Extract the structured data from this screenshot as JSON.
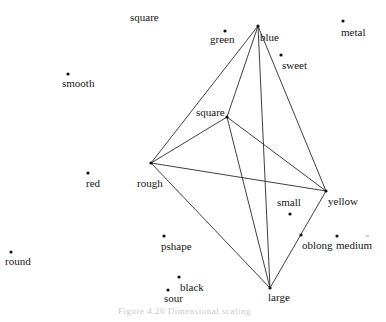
{
  "figure": {
    "caption": "Figure 4.26   Dimensional scaling"
  },
  "nodes": [
    {
      "id": "blue",
      "label": "blue",
      "x": 258,
      "y": 26,
      "lx": 260,
      "ly": 41,
      "dot": true
    },
    {
      "id": "green",
      "label": "green",
      "x": 225,
      "y": 31,
      "lx": 210,
      "ly": 43,
      "dot": true
    },
    {
      "id": "metal",
      "label": "metal",
      "x": 343,
      "y": 21,
      "lx": 341,
      "ly": 36,
      "dot": true
    },
    {
      "id": "sweet",
      "label": "sweet",
      "x": 281,
      "y": 55,
      "lx": 282,
      "ly": 69,
      "dot": true
    },
    {
      "id": "square-top",
      "label": "square",
      "x": 0,
      "y": 0,
      "lx": 130,
      "ly": 21,
      "dot": false
    },
    {
      "id": "smooth",
      "label": "smooth",
      "x": 68,
      "y": 74,
      "lx": 62,
      "ly": 87,
      "dot": true
    },
    {
      "id": "square",
      "label": "square",
      "x": 227,
      "y": 117,
      "lx": 196,
      "ly": 116,
      "dot": true
    },
    {
      "id": "rough",
      "label": "rough",
      "x": 151,
      "y": 163,
      "lx": 137,
      "ly": 187,
      "dot": true
    },
    {
      "id": "red",
      "label": "red",
      "x": 88,
      "y": 173,
      "lx": 86,
      "ly": 187,
      "dot": true
    },
    {
      "id": "yellow",
      "label": "yellow",
      "x": 326,
      "y": 191,
      "lx": 328,
      "ly": 205,
      "dot": true
    },
    {
      "id": "small",
      "label": "small",
      "x": 290,
      "y": 214,
      "lx": 277,
      "ly": 206,
      "dot": true
    },
    {
      "id": "oblong",
      "label": "oblong",
      "x": 301,
      "y": 235,
      "lx": 302,
      "ly": 249,
      "dot": true
    },
    {
      "id": "medium",
      "label": "medium",
      "x": 337,
      "y": 236,
      "lx": 336,
      "ly": 249,
      "dot": true
    },
    {
      "id": "round",
      "label": "round",
      "x": 11,
      "y": 252,
      "lx": 5,
      "ly": 265,
      "dot": true
    },
    {
      "id": "pshape",
      "label": "pshape",
      "x": 164,
      "y": 236,
      "lx": 161,
      "ly": 250,
      "dot": true
    },
    {
      "id": "black",
      "label": "black",
      "x": 179,
      "y": 277,
      "lx": 180,
      "ly": 291,
      "dot": true
    },
    {
      "id": "sour",
      "label": "sour",
      "x": 168,
      "y": 290,
      "lx": 164,
      "ly": 302,
      "dot": true
    },
    {
      "id": "large",
      "label": "large",
      "x": 270,
      "y": 288,
      "lx": 268,
      "ly": 301,
      "dot": true
    }
  ],
  "edges": [
    [
      "rough",
      "blue"
    ],
    [
      "rough",
      "square"
    ],
    [
      "rough",
      "yellow"
    ],
    [
      "rough",
      "large"
    ],
    [
      "blue",
      "square"
    ],
    [
      "blue",
      "large"
    ],
    [
      "blue",
      "yellow"
    ],
    [
      "square",
      "large"
    ],
    [
      "square",
      "yellow"
    ],
    [
      "yellow",
      "large"
    ]
  ],
  "marks": [
    {
      "name": "medium-tick",
      "x1": 366,
      "y1": 236,
      "x2": 369,
      "y2": 236
    }
  ]
}
